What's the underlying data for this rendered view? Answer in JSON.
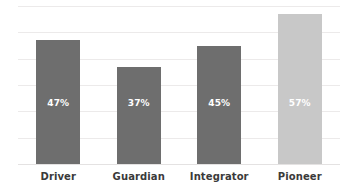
{
  "chart_data": {
    "type": "bar",
    "title": "",
    "subtitle": "",
    "xlabel": "",
    "ylabel": "",
    "categories": [
      "Driver",
      "Guardian",
      "Integrator",
      "Pioneer"
    ],
    "values": [
      47,
      37,
      45,
      57
    ],
    "value_labels": [
      "47%",
      "37%",
      "45%",
      "57%"
    ],
    "ylim": [
      0,
      60
    ],
    "grid": true,
    "gridline_values": [
      10,
      20,
      30,
      40,
      50,
      60
    ],
    "legend": "none",
    "orientation": "vertical",
    "bar_colors": [
      "#6e6e6e",
      "#6e6e6e",
      "#6e6e6e",
      "#c8c8c8"
    ],
    "highlighted_category": "Pioneer",
    "value_label_color": "#ffffff",
    "gridline_color": "#eceaea",
    "background_color": "#ffffff",
    "category_label_color": "#3a3a3a"
  }
}
